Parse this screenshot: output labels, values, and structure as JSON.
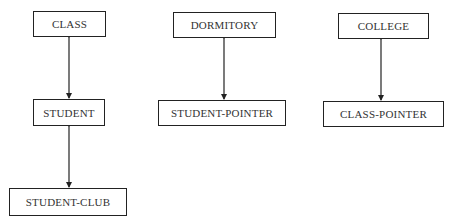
{
  "diagram": {
    "nodes": [
      {
        "id": "class",
        "label": "CLASS"
      },
      {
        "id": "student",
        "label": "STUDENT"
      },
      {
        "id": "student-club",
        "label": "STUDENT-CLUB"
      },
      {
        "id": "dormitory",
        "label": "DORMITORY"
      },
      {
        "id": "student-pointer",
        "label": "STUDENT-POINTER"
      },
      {
        "id": "college",
        "label": "COLLEGE"
      },
      {
        "id": "class-pointer",
        "label": "CLASS-POINTER"
      }
    ],
    "edges": [
      {
        "from": "CLASS",
        "to": "STUDENT",
        "type": "bidirectional"
      },
      {
        "from": "STUDENT",
        "to": "STUDENT-CLUB",
        "type": "bidirectional"
      },
      {
        "from": "DORMITORY",
        "to": "STUDENT-POINTER",
        "type": "bidirectional"
      },
      {
        "from": "COLLEGE",
        "to": "CLASS-POINTER",
        "type": "bidirectional"
      }
    ],
    "line_color": "#222222"
  }
}
